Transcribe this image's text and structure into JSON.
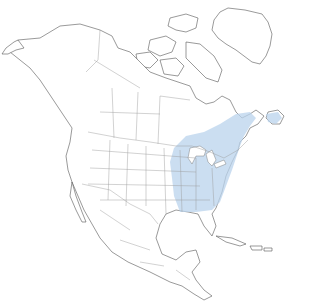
{
  "map": {
    "type": "species-range-map",
    "region": "North America",
    "colors": {
      "background": "#ffffff",
      "land": "#ffffff",
      "coastline": "#555555",
      "borders": "#9a9a9a",
      "range": "#b9d3ec"
    },
    "range_label": "year-round range",
    "range_extent": "Eastern United States and southeastern Canada, from the Great Plains east to the Atlantic coast, south to the Gulf states",
    "legend_visible": false
  }
}
